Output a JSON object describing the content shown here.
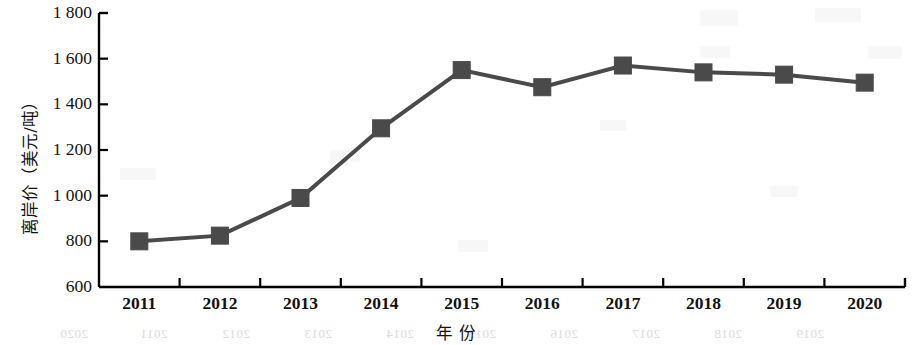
{
  "chart_data": {
    "type": "line",
    "title": "",
    "subtitle": "",
    "xlabel": "年  份",
    "ylabel": "离岸价（美元/吨）",
    "categories": [
      "2011",
      "2012",
      "2013",
      "2014",
      "2015",
      "2016",
      "2017",
      "2018",
      "2019",
      "2020"
    ],
    "series": [
      {
        "name": "离岸价",
        "values": [
          800,
          825,
          990,
          1295,
          1550,
          1475,
          1570,
          1540,
          1530,
          1495
        ],
        "color": "#4a4a4a",
        "marker": "square",
        "marker_size": 17,
        "line_width": 4
      }
    ],
    "ylim": [
      600,
      1800
    ],
    "ytick_values": [
      1800,
      1600,
      1400,
      1200,
      1000,
      800,
      600
    ],
    "ytick_labels": [
      "1 800",
      "1 600",
      "1 400",
      "1 200",
      "1 000",
      "800",
      "600"
    ],
    "grid": false,
    "legend": false,
    "legend_position": "none",
    "axis_color": "#000000",
    "background": "#ffffff"
  },
  "ghost_artifacts": {
    "note_labels": [
      "2020",
      "2011",
      "2012",
      "2013",
      "2014",
      "2015",
      "2016",
      "2017",
      "2018",
      "2019",
      "2020"
    ]
  }
}
